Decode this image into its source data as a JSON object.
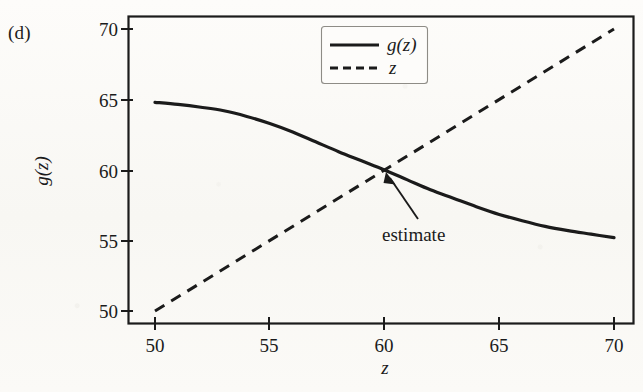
{
  "figure": {
    "panel_label": "(d)",
    "background_color": "#fbfaf7",
    "ink_color": "#1b1b1b"
  },
  "chart_data": {
    "type": "line",
    "title": "",
    "subtitle": "",
    "panel": "(d)",
    "xlabel": "z",
    "ylabel": "g(z)",
    "xlim": [
      49.0,
      71.5
    ],
    "ylim": [
      48.8,
      70.8
    ],
    "xticks": [
      50,
      55,
      60,
      65,
      70
    ],
    "xtick_labels": [
      "50",
      "55",
      "60",
      "65",
      "70"
    ],
    "yticks": [
      50,
      55,
      60,
      65,
      70
    ],
    "ytick_labels": [
      "50",
      "55",
      "60",
      "65",
      "70"
    ],
    "grid": false,
    "frame": true,
    "legend_position": "top-center",
    "legend_entries": [
      {
        "label": "g(z)",
        "style": "solid"
      },
      {
        "label": "z",
        "style": "dashed"
      }
    ],
    "series": [
      {
        "name": "g(z)",
        "style": "solid",
        "color": "#1b1b1b",
        "x": [
          50,
          51,
          52,
          53,
          54,
          55,
          56,
          57,
          58,
          59,
          60,
          61,
          62,
          63,
          64,
          65,
          66,
          67,
          68,
          69,
          70
        ],
        "values": [
          64.8,
          64.65,
          64.45,
          64.2,
          63.8,
          63.3,
          62.7,
          62.0,
          61.3,
          60.65,
          60.0,
          59.3,
          58.6,
          58.0,
          57.4,
          56.85,
          56.4,
          56.0,
          55.7,
          55.45,
          55.2
        ]
      },
      {
        "name": "z",
        "style": "dashed",
        "color": "#1b1b1b",
        "x": [
          50,
          70
        ],
        "values": [
          50,
          70
        ]
      }
    ],
    "annotations": [
      {
        "text": "estimate",
        "kind": "arrow-annotation",
        "point_x": 60.0,
        "point_y": 60.0,
        "text_x": 62.2,
        "text_y": 57.3
      }
    ],
    "intersection": {
      "x": 60.0,
      "y": 60.0,
      "label": "estimate"
    }
  }
}
